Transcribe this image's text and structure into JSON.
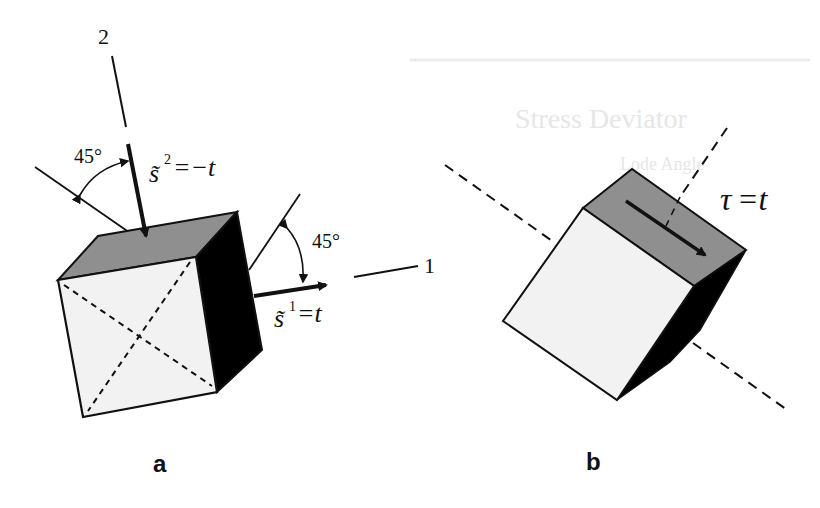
{
  "figure": {
    "background_ghost_text": {
      "heading": "Stress Deviator",
      "subheading": "Lode Angle"
    },
    "panel_a": {
      "label": "a",
      "axis_2_label": "2",
      "axis_1_label": "1",
      "angle_left_label": "45°",
      "angle_right_label": "45°",
      "stress_2": {
        "symbol": "s̃",
        "superscript": "2",
        "rhs": "=−t"
      },
      "stress_1": {
        "symbol": "s̃",
        "superscript": "1",
        "rhs": "=t"
      }
    },
    "panel_b": {
      "label": "b",
      "shear_label": {
        "symbol": "τ",
        "rhs": "=t"
      }
    },
    "colors": {
      "front_face": "#f2f2f2",
      "top_face": "#8f8f8f",
      "side_face": "#000000",
      "stroke": "#111111"
    }
  }
}
